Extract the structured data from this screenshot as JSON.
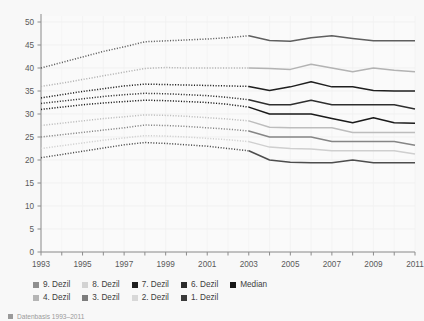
{
  "chart_data": {
    "type": "line",
    "title": "",
    "xlabel": "",
    "ylabel": "",
    "xlim": [
      1993,
      2011
    ],
    "ylim": [
      0,
      50
    ],
    "y_ticks": [
      0,
      5,
      10,
      15,
      20,
      25,
      30,
      35,
      40,
      45,
      50
    ],
    "x_ticks": [
      1993,
      1994,
      1995,
      1996,
      1997,
      1998,
      1999,
      2000,
      2001,
      2002,
      2003,
      2004,
      2005,
      2006,
      2007,
      2008,
      2009,
      2010,
      2011
    ],
    "x_tick_labels": [
      "1993",
      "",
      "1995",
      "",
      "1997",
      "",
      "1999",
      "",
      "2001",
      "",
      "2003",
      "",
      "2005",
      "",
      "2007",
      "",
      "2009",
      "",
      "2011"
    ],
    "grid": true,
    "legend_position": "bottom",
    "break_year": 2003,
    "note": "Values up to 2003 drawn dotted, from 2003 drawn solid",
    "x": [
      1993,
      1994,
      1995,
      1996,
      1997,
      1998,
      1999,
      2000,
      2001,
      2002,
      2003,
      2004,
      2005,
      2006,
      2007,
      2008,
      2009,
      2010,
      2011
    ],
    "series": [
      {
        "name": "9. Dezil",
        "color": "#5f5f5f",
        "values": [
          40.0,
          41.2,
          42.4,
          43.6,
          44.6,
          45.7,
          45.9,
          46.1,
          46.3,
          46.6,
          47.0,
          46.0,
          45.8,
          46.6,
          47.0,
          46.4,
          45.9,
          45.9,
          45.9
        ]
      },
      {
        "name": "8. Dezil",
        "color": "#b3b3b3",
        "values": [
          36.0,
          36.7,
          37.5,
          38.3,
          39.1,
          39.9,
          40.1,
          40.0,
          40.0,
          40.0,
          40.0,
          39.9,
          39.7,
          40.8,
          40.0,
          39.2,
          40.0,
          39.5,
          39.2
        ]
      },
      {
        "name": "7. Dezil",
        "color": "#1f1f1f",
        "values": [
          33.5,
          34.2,
          34.9,
          35.5,
          36.1,
          36.5,
          36.4,
          36.3,
          36.2,
          36.1,
          36.0,
          35.1,
          35.9,
          37.0,
          35.9,
          35.9,
          35.1,
          35.0,
          35.0
        ]
      },
      {
        "name": "6. Dezil",
        "color": "#2e2e2e",
        "values": [
          32.3,
          32.8,
          33.3,
          33.8,
          34.2,
          34.5,
          34.4,
          34.2,
          34.0,
          33.6,
          33.1,
          32.0,
          32.0,
          33.0,
          32.0,
          32.0,
          32.0,
          32.0,
          31.1
        ]
      },
      {
        "name": "Median",
        "color": "#1a1a1a",
        "values": [
          31.0,
          31.5,
          32.0,
          32.4,
          32.7,
          33.0,
          32.9,
          32.7,
          32.5,
          32.1,
          31.5,
          30.0,
          30.0,
          30.0,
          29.0,
          28.1,
          29.2,
          28.1,
          28.0
        ]
      },
      {
        "name": "4. Dezil",
        "color": "#bdbdbd",
        "values": [
          27.5,
          28.0,
          28.5,
          29.0,
          29.4,
          29.8,
          29.7,
          29.5,
          29.2,
          28.9,
          28.5,
          27.1,
          27.0,
          27.0,
          27.0,
          26.0,
          26.0,
          26.0,
          26.0
        ]
      },
      {
        "name": "3. Dezil",
        "color": "#858585",
        "values": [
          25.0,
          25.5,
          26.0,
          26.5,
          27.0,
          27.6,
          27.5,
          27.3,
          27.0,
          26.7,
          26.3,
          25.0,
          25.0,
          25.0,
          24.0,
          24.0,
          24.0,
          24.0,
          23.2
        ]
      },
      {
        "name": "2. Dezil",
        "color": "#cfcfcf",
        "values": [
          22.5,
          23.1,
          23.7,
          24.3,
          24.8,
          25.3,
          25.2,
          25.0,
          24.7,
          24.4,
          24.0,
          22.8,
          22.5,
          22.4,
          22.0,
          22.0,
          22.0,
          22.0,
          21.3
        ]
      },
      {
        "name": "1. Dezil",
        "color": "#4d4d4d",
        "values": [
          20.5,
          21.2,
          21.9,
          22.6,
          23.3,
          23.8,
          23.6,
          23.3,
          23.0,
          22.5,
          22.0,
          20.0,
          19.5,
          19.4,
          19.4,
          20.0,
          19.4,
          19.4,
          19.4
        ]
      }
    ]
  },
  "legend": {
    "row1": [
      {
        "label": "9. Dezil",
        "color": "#8f8f8f"
      },
      {
        "label": "8. Dezil",
        "color": "#d3d3d3"
      },
      {
        "label": "7. Dezil",
        "color": "#1f1f1f"
      },
      {
        "label": "6. Dezil",
        "color": "#2b2b2b"
      },
      {
        "label": "Median",
        "color": "#161616"
      }
    ],
    "row2": [
      {
        "label": "4. Dezil",
        "color": "#b5b5b5"
      },
      {
        "label": "3. Dezil",
        "color": "#7d7d7d"
      },
      {
        "label": "2. Dezil",
        "color": "#d8d8d8"
      },
      {
        "label": "1. Dezil",
        "color": "#3a3a3a"
      }
    ]
  },
  "footnote": {
    "text": "Datenbasis 1993–2011"
  }
}
